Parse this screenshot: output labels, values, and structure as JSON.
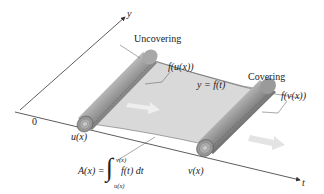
{
  "diagram": {
    "axes": {
      "y_label": "y",
      "t_label": "t",
      "origin_label": "0"
    },
    "labels": {
      "uncovering": "Uncovering",
      "covering": "Covering",
      "f_u": "f(u(x))",
      "f_v": "f(v(x))",
      "curve": "y = f(t)",
      "u": "u(x)",
      "v": "v(x)"
    },
    "formula": {
      "lhs": "A(x) =",
      "integral_sign": "∫",
      "upper_limit": "v(x)",
      "lower_limit": "u(x)",
      "integrand": "f(t) dt"
    },
    "colors": {
      "sheet": "#d9d9d9",
      "roll_dark": "#4a4a4a",
      "roll_light": "#bdbdbd",
      "arrow_hint": "#e6e6e6",
      "axis": "#333333"
    }
  }
}
